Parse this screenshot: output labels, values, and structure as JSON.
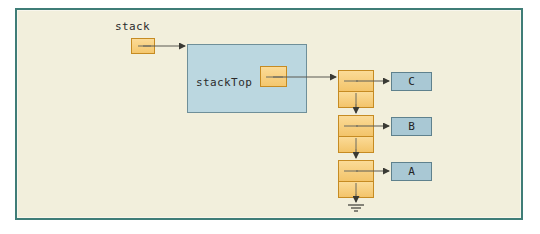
{
  "diagram": {
    "colors": {
      "frame_border": "#3f7d77",
      "page_background": "#f2efdc",
      "pointer_fill": "#f6cd7b",
      "pointer_border": "#c68b22",
      "object_panel_fill": "#bbd7e0",
      "object_panel_border": "#6f8f99",
      "data_box_fill": "#a9c8d4",
      "data_box_border": "#5f818d",
      "line": "#5a5a52"
    },
    "labels": {
      "stack": "stack",
      "stack_top": "stackTop"
    },
    "nodes": [
      {
        "id": "node-1",
        "data_label": "C"
      },
      {
        "id": "node-2",
        "data_label": "B"
      },
      {
        "id": "node-3",
        "data_label": "A"
      }
    ],
    "terminator": {
      "name": "null-ground-symbol",
      "meaning": "null"
    }
  }
}
